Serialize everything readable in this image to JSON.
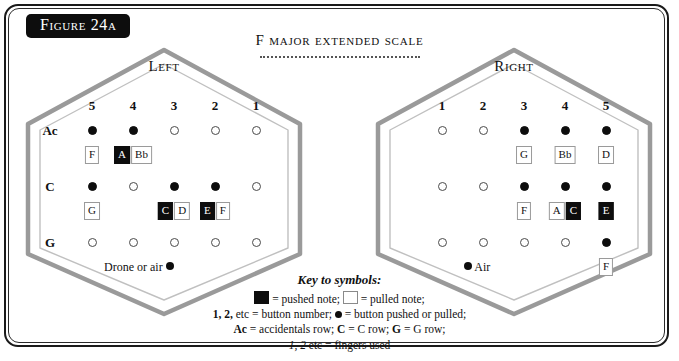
{
  "figure": {
    "label": "Figure 24a"
  },
  "title": {
    "text": "F major extended scale"
  },
  "colors": {
    "ink": "#0d0d0d",
    "hex_outer": "#9a9a9a",
    "hex_inner": "#b5b5b5",
    "pushed_bg": "#0d0d0d",
    "pulled_bg": "#ffffff",
    "pulled_border": "#9a9a9a"
  },
  "left": {
    "side_label": "Left",
    "column_numbers": [
      "5",
      "4",
      "3",
      "2",
      "1"
    ],
    "row_labels": [
      "Ac",
      "C",
      "G"
    ],
    "air_caption": "Drone or air",
    "rows": [
      {
        "label": "Ac",
        "buttons": [
          "filled",
          "filled",
          "open",
          "open",
          "open"
        ],
        "notes": [
          {
            "col": 0,
            "items": [
              {
                "text": "F",
                "state": "pulled"
              }
            ]
          },
          {
            "col": 1,
            "items": [
              {
                "text": "A",
                "state": "pushed"
              },
              {
                "text": "Bb",
                "state": "pulled"
              }
            ]
          }
        ]
      },
      {
        "label": "C",
        "buttons": [
          "filled",
          "open",
          "filled",
          "filled",
          "open"
        ],
        "notes": [
          {
            "col": 0,
            "items": [
              {
                "text": "G",
                "state": "pulled"
              }
            ]
          },
          {
            "col": 2,
            "items": [
              {
                "text": "C",
                "state": "pushed"
              },
              {
                "text": "D",
                "state": "pulled"
              }
            ]
          },
          {
            "col": 3,
            "items": [
              {
                "text": "E",
                "state": "pushed"
              },
              {
                "text": "F",
                "state": "pulled"
              }
            ]
          }
        ]
      },
      {
        "label": "G",
        "buttons": [
          "open",
          "open",
          "open",
          "open",
          "open"
        ],
        "notes": []
      }
    ]
  },
  "right": {
    "side_label": "Right",
    "column_numbers": [
      "1",
      "2",
      "3",
      "4",
      "5"
    ],
    "row_labels": [
      "",
      "",
      ""
    ],
    "air_caption": "Air",
    "rows": [
      {
        "label": "",
        "buttons": [
          "open",
          "open",
          "filled",
          "filled",
          "filled"
        ],
        "notes": [
          {
            "col": 2,
            "items": [
              {
                "text": "G",
                "state": "pulled"
              }
            ]
          },
          {
            "col": 3,
            "items": [
              {
                "text": "Bb",
                "state": "pulled"
              }
            ]
          },
          {
            "col": 4,
            "items": [
              {
                "text": "D",
                "state": "pulled"
              }
            ]
          }
        ]
      },
      {
        "label": "",
        "buttons": [
          "open",
          "open",
          "filled",
          "filled",
          "filled"
        ],
        "notes": [
          {
            "col": 2,
            "items": [
              {
                "text": "F",
                "state": "pulled"
              }
            ]
          },
          {
            "col": 3,
            "items": [
              {
                "text": "A",
                "state": "pulled"
              },
              {
                "text": "C",
                "state": "pushed"
              }
            ]
          },
          {
            "col": 4,
            "items": [
              {
                "text": "E",
                "state": "pushed"
              }
            ]
          }
        ]
      },
      {
        "label": "",
        "buttons": [
          "open",
          "open",
          "open",
          "open",
          "filled"
        ],
        "notes": [
          {
            "col": 4,
            "items": [
              {
                "text": "F",
                "state": "pulled"
              }
            ]
          }
        ]
      }
    ]
  },
  "key": {
    "title": "Key to symbols:",
    "line1_a": "= pushed note;",
    "line1_b": "= pulled note;",
    "line2_a": "1, 2,",
    "line2_b": "etc = button number;",
    "line2_c": "= button pushed or pulled;",
    "line3_a": "Ac",
    "line3_b": "= accidentals row;",
    "line3_c": "C",
    "line3_d": "= C row;",
    "line3_e": "G",
    "line3_f": "= G row;",
    "line4_a": "1, 2",
    "line4_b": "etc = fingers used"
  }
}
